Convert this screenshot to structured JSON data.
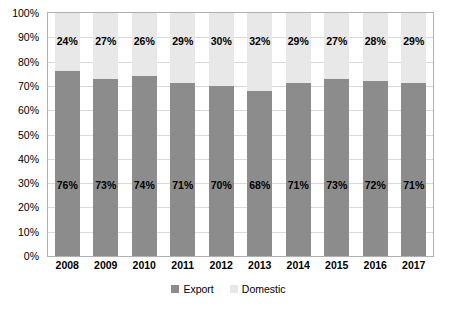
{
  "chart_data": {
    "type": "bar",
    "subtype": "stacked-percent",
    "title": "",
    "xlabel": "",
    "ylabel": "",
    "ylim": [
      0,
      100
    ],
    "ytick_labels": [
      "0%",
      "10%",
      "20%",
      "30%",
      "40%",
      "50%",
      "60%",
      "70%",
      "80%",
      "90%",
      "100%"
    ],
    "ytick_values": [
      0,
      10,
      20,
      30,
      40,
      50,
      60,
      70,
      80,
      90,
      100
    ],
    "grid": true,
    "legend_position": "bottom",
    "categories": [
      "2008",
      "2009",
      "2010",
      "2011",
      "2012",
      "2013",
      "2014",
      "2015",
      "2016",
      "2017"
    ],
    "series": [
      {
        "name": "Export",
        "color": "#8c8c8c",
        "values": [
          76,
          73,
          74,
          71,
          70,
          68,
          71,
          73,
          72,
          71
        ],
        "labels": [
          "76%",
          "73%",
          "74%",
          "71%",
          "70%",
          "68%",
          "71%",
          "73%",
          "72%",
          "71%"
        ]
      },
      {
        "name": "Domestic",
        "color": "#e8e8e8",
        "values": [
          24,
          27,
          26,
          29,
          30,
          32,
          29,
          27,
          28,
          29
        ],
        "labels": [
          "24%",
          "27%",
          "26%",
          "29%",
          "30%",
          "32%",
          "29%",
          "27%",
          "28%",
          "29%"
        ]
      }
    ]
  },
  "legend": {
    "items": [
      {
        "label": "Export",
        "color": "#8c8c8c"
      },
      {
        "label": "Domestic",
        "color": "#e8e8e8"
      }
    ]
  }
}
